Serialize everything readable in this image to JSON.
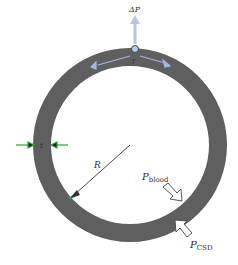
{
  "diagram": {
    "labels": {
      "delta_p": "ΔP",
      "tension": "T",
      "thickness": "t",
      "radius": "R",
      "p_blood": "P",
      "p_blood_sub": "blood",
      "p_csd": "P",
      "p_csd_sub": "CSD"
    },
    "colors": {
      "ring": "#5f5f5f",
      "delta_p_arrow": "#b9c3e6",
      "tension_arrows": "#aab4dc",
      "thickness_arrows": "#2fa53a",
      "radius_arrow": "#333333",
      "pressure_arrows_outline": "#444444"
    }
  }
}
